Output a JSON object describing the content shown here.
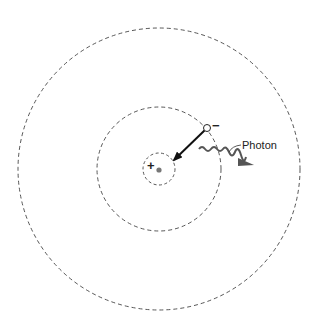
{
  "diagram": {
    "labels": {
      "photon": "Photon",
      "electron_charge": "−",
      "nucleus_charge": "+"
    },
    "colors": {
      "line": "#333333",
      "nucleus": "#777777",
      "photon": "#555555"
    },
    "orbits": [
      {
        "name": "inner-orbit",
        "r": 16
      },
      {
        "name": "middle-orbit",
        "r": 62
      },
      {
        "name": "outer-orbit",
        "r": 141
      }
    ]
  }
}
